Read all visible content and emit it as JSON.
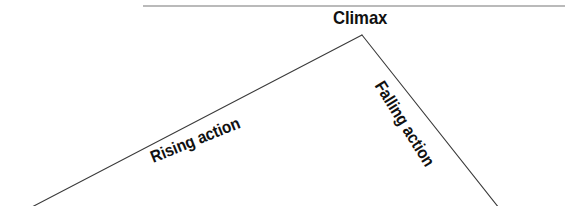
{
  "diagram": {
    "type": "plot-structure-diagram",
    "background_color": "#ffffff",
    "stroke_color": "#3a3a3a",
    "rule_color": "#777777",
    "text_color": "#111111",
    "canvas": {
      "width": 578,
      "height": 206
    },
    "labels": {
      "climax": "Climax",
      "rising_action": "Rising action",
      "falling_action": "Falling action"
    },
    "shapes": {
      "top_rule": {
        "x1": 143,
        "y1": 6,
        "x2": 565,
        "y2": 6,
        "stroke_width": 1.2
      },
      "rising_line": {
        "x1": 30,
        "y1": 208,
        "x2": 362,
        "y2": 35,
        "stroke_width": 1.1
      },
      "falling_line": {
        "x1": 362,
        "y1": 35,
        "x2": 499,
        "y2": 208,
        "stroke_width": 1.1
      },
      "apex": {
        "x": 362,
        "y": 35
      }
    },
    "label_angles": {
      "climax_deg": 0,
      "rising_action_deg": -22,
      "falling_action_deg": 58
    }
  }
}
